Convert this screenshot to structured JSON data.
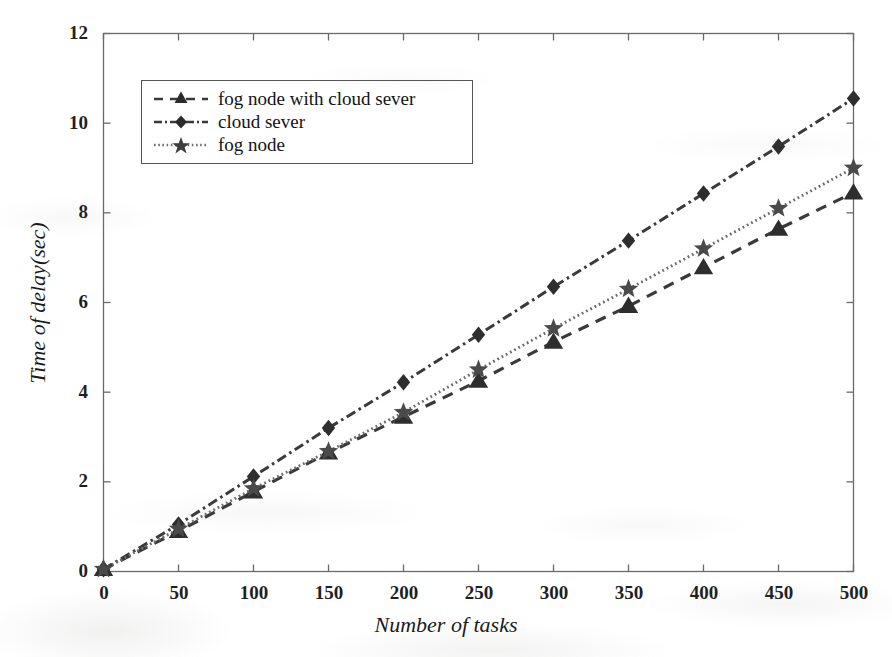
{
  "chart_data": {
    "type": "line",
    "title": "",
    "xlabel": "Number of tasks",
    "ylabel": "Time of delay(sec)",
    "xlim": [
      0,
      500
    ],
    "ylim": [
      0,
      12
    ],
    "x": [
      0,
      50,
      100,
      150,
      200,
      250,
      300,
      350,
      400,
      450,
      500
    ],
    "xticks": [
      "0",
      "50",
      "100",
      "150",
      "200",
      "250",
      "300",
      "350",
      "400",
      "450",
      "500"
    ],
    "yticks": [
      "0",
      "2",
      "4",
      "6",
      "8",
      "10",
      "12"
    ],
    "grid": false,
    "legend_position": "upper left",
    "series": [
      {
        "name": "fog node with cloud sever",
        "marker": "triangle",
        "linestyle": "dashed",
        "color": "#3a3a3a",
        "values": [
          0.05,
          0.9,
          1.78,
          2.65,
          3.45,
          4.25,
          5.12,
          5.92,
          6.78,
          7.64,
          8.45
        ]
      },
      {
        "name": "cloud sever",
        "marker": "diamond",
        "linestyle": "dash-dot",
        "color": "#3a3a3a",
        "values": [
          0.05,
          1.05,
          2.12,
          3.2,
          4.22,
          5.28,
          6.35,
          7.38,
          8.43,
          9.48,
          10.55
        ]
      },
      {
        "name": "fog node",
        "marker": "star",
        "linestyle": "dotted",
        "color": "#6d6d6d",
        "values": [
          0.05,
          0.95,
          1.85,
          2.68,
          3.55,
          4.5,
          5.42,
          6.3,
          7.2,
          8.1,
          9.0
        ]
      }
    ]
  },
  "legend": {
    "items": [
      {
        "label": "fog node with cloud sever"
      },
      {
        "label": "cloud sever"
      },
      {
        "label": "fog node"
      }
    ]
  },
  "axes": {
    "x_title": "Number of tasks",
    "y_title": "Time of delay(sec)"
  }
}
